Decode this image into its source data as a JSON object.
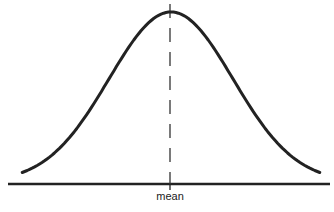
{
  "diagram": {
    "type": "bell-curve",
    "distribution": "normal",
    "mean_label": "mean",
    "x_range_sd": [
      -2.4,
      2.4
    ],
    "colors": {
      "line": "#222222",
      "background": "#ffffff"
    }
  }
}
